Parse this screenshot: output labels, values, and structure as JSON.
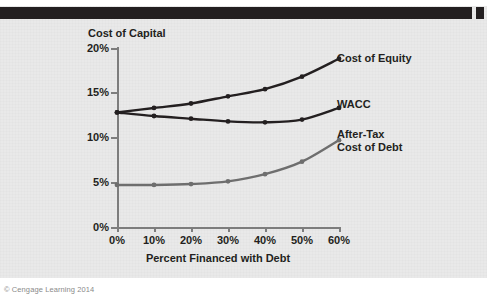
{
  "figure": {
    "credit": "© Cengage Learning 2014"
  },
  "chart_data": {
    "type": "line",
    "title": "",
    "xlabel": "Percent Financed with Debt",
    "ylabel": "Cost of Capital",
    "x": [
      0,
      10,
      20,
      30,
      40,
      50,
      60
    ],
    "xtick_labels": [
      "0%",
      "10%",
      "20%",
      "30%",
      "40%",
      "50%",
      "60%"
    ],
    "ytick_labels": [
      "0%",
      "5%",
      "10%",
      "15%",
      "20%"
    ],
    "yticks": [
      0,
      5,
      10,
      15,
      20
    ],
    "ylim": [
      0,
      20
    ],
    "xlim": [
      0,
      60
    ],
    "grid": false,
    "legend_position": "right-inline-labels",
    "series": [
      {
        "name": "Cost of Equity",
        "color": "#231f20",
        "values": [
          12.8,
          13.3,
          13.8,
          14.6,
          15.4,
          16.8,
          18.8
        ]
      },
      {
        "name": "WACC",
        "color": "#231f20",
        "values": [
          12.8,
          12.4,
          12.1,
          11.8,
          11.7,
          12.0,
          13.3
        ]
      },
      {
        "name": "After-Tax Cost of Debt",
        "color": "#6e6e6e",
        "values": [
          4.7,
          4.7,
          4.8,
          5.1,
          5.9,
          7.3,
          9.7
        ]
      }
    ],
    "annotations": [
      {
        "text": "Cost of Equity",
        "series": "Cost of Equity"
      },
      {
        "text": "WACC",
        "series": "WACC"
      },
      {
        "text": "After-Tax",
        "series": "After-Tax Cost of Debt"
      },
      {
        "text": "Cost of Debt",
        "series": "After-Tax Cost of Debt"
      }
    ]
  }
}
